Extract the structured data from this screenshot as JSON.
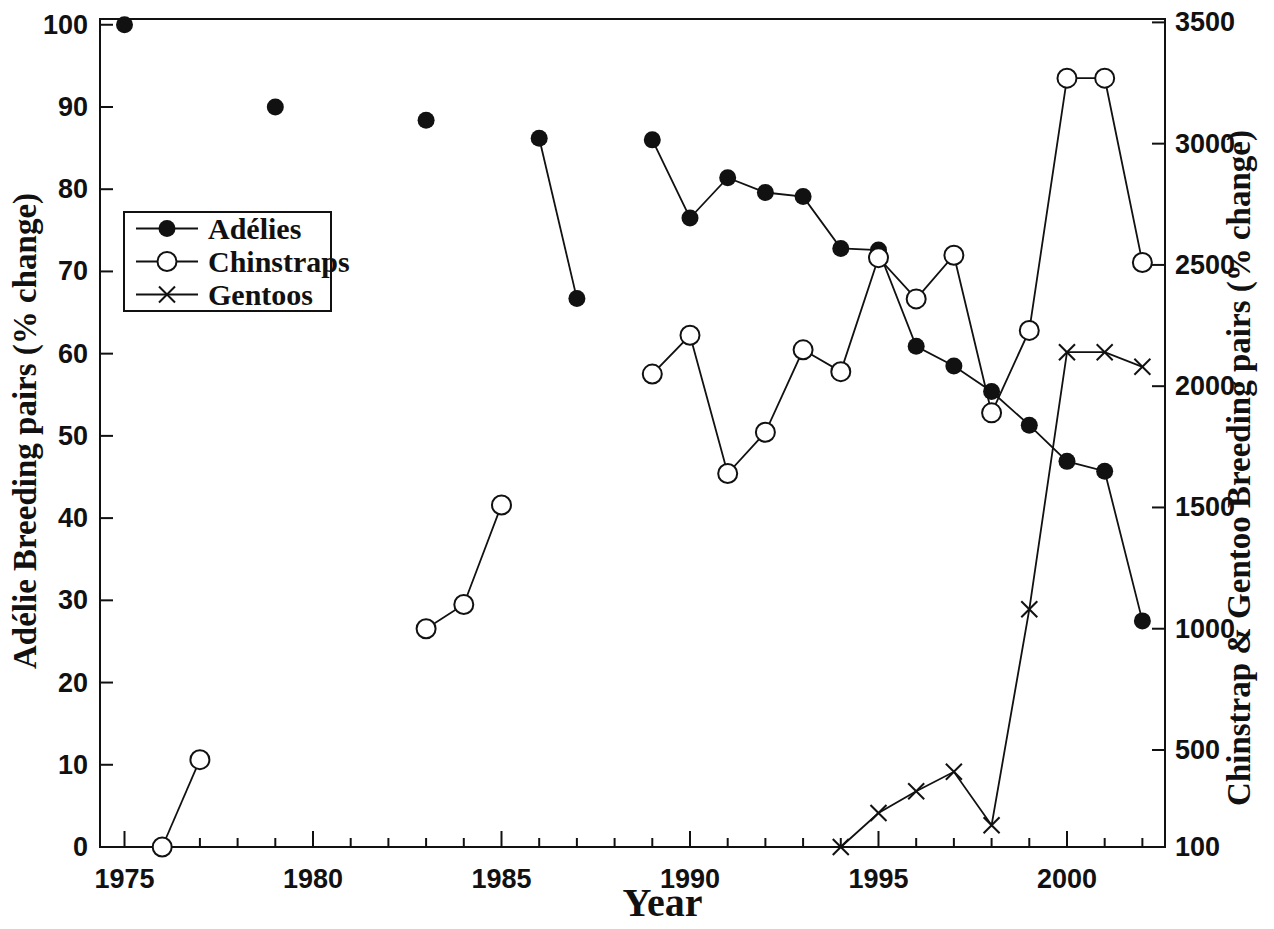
{
  "chart_data": {
    "type": "line",
    "title": "",
    "xlabel": "Year",
    "left_axis_label": "Adélie Breeding pairs (% change)",
    "right_axis_label": "Chinstrap & Gentoo Breeding pairs (% change)",
    "x_axis": {
      "min": 1974.35,
      "max": 2002.6,
      "minor_from": 1975,
      "minor_to": 2002,
      "major_ticks": [
        1975,
        1980,
        1985,
        1990,
        1995,
        2000
      ],
      "major_tick_labels": [
        "1975",
        "1980",
        "1985",
        "1990",
        "1995",
        "2000"
      ]
    },
    "y_left": {
      "min": 0,
      "max": 100.7,
      "ticks": [
        0,
        10,
        20,
        30,
        40,
        50,
        60,
        70,
        80,
        90,
        100
      ],
      "tick_labels": [
        "0",
        "10",
        "20",
        "30",
        "40",
        "50",
        "60",
        "70",
        "80",
        "90",
        "100"
      ]
    },
    "y_right": {
      "min": 100,
      "max": 3514,
      "ticks": [
        100,
        500,
        1000,
        1500,
        2000,
        2500,
        3000,
        3500
      ],
      "tick_labels": [
        "100",
        "500",
        "1000",
        "1500",
        "2000",
        "2500",
        "3000",
        "3500"
      ]
    },
    "series": [
      {
        "name": "Adélies",
        "axis": "left",
        "marker": "filled-circle",
        "segments": [
          [
            [
              1975,
              100
            ]
          ],
          [
            [
              1979,
              90
            ]
          ],
          [
            [
              1983,
              88.4
            ]
          ],
          [
            [
              1986,
              86.2
            ],
            [
              1987,
              66.7
            ]
          ],
          [
            [
              1989,
              86
            ],
            [
              1990,
              76.5
            ],
            [
              1991,
              81.4
            ],
            [
              1992,
              79.6
            ],
            [
              1993,
              79.1
            ],
            [
              1994,
              72.8
            ],
            [
              1995,
              72.6
            ],
            [
              1996,
              60.9
            ],
            [
              1997,
              58.5
            ],
            [
              1998,
              55.4
            ],
            [
              1999,
              51.3
            ],
            [
              2000,
              46.9
            ],
            [
              2001,
              45.7
            ],
            [
              2002,
              27.5
            ]
          ]
        ]
      },
      {
        "name": "Chinstraps",
        "axis": "right",
        "marker": "open-circle",
        "segments": [
          [
            [
              1976,
              100
            ],
            [
              1977,
              460
            ]
          ],
          [
            [
              1983,
              1000
            ],
            [
              1984,
              1100
            ],
            [
              1985,
              1510
            ]
          ],
          [
            [
              1989,
              2050
            ],
            [
              1990,
              2210
            ],
            [
              1991,
              1640
            ],
            [
              1992,
              1810
            ],
            [
              1993,
              2150
            ],
            [
              1994,
              2060
            ],
            [
              1995,
              2530
            ],
            [
              1996,
              2360
            ],
            [
              1997,
              2540
            ],
            [
              1998,
              1890
            ],
            [
              1999,
              2230
            ],
            [
              2000,
              3270
            ],
            [
              2001,
              3270
            ],
            [
              2002,
              2510
            ]
          ]
        ]
      },
      {
        "name": "Gentoos",
        "axis": "right",
        "marker": "x-cross",
        "segments": [
          [
            [
              1994,
              100
            ],
            [
              1995,
              240
            ],
            [
              1996,
              330
            ],
            [
              1997,
              410
            ],
            [
              1998,
              190
            ],
            [
              1999,
              1080
            ],
            [
              2000,
              2140
            ],
            [
              2001,
              2140
            ],
            [
              2002,
              2080
            ]
          ]
        ]
      }
    ],
    "legend": {
      "position": "upper-left",
      "items": [
        "Adélies",
        "Chinstraps",
        "Gentoos"
      ]
    },
    "colors": {
      "ink": "#111111",
      "background": "#ffffff"
    },
    "grid": false,
    "layout": {
      "width": 1274,
      "height": 929,
      "plot": {
        "left": 100,
        "right": 1165,
        "top": 19,
        "bottom": 847
      },
      "legend_box": {
        "x": 124,
        "y": 212,
        "w": 207,
        "h": 99
      }
    }
  }
}
